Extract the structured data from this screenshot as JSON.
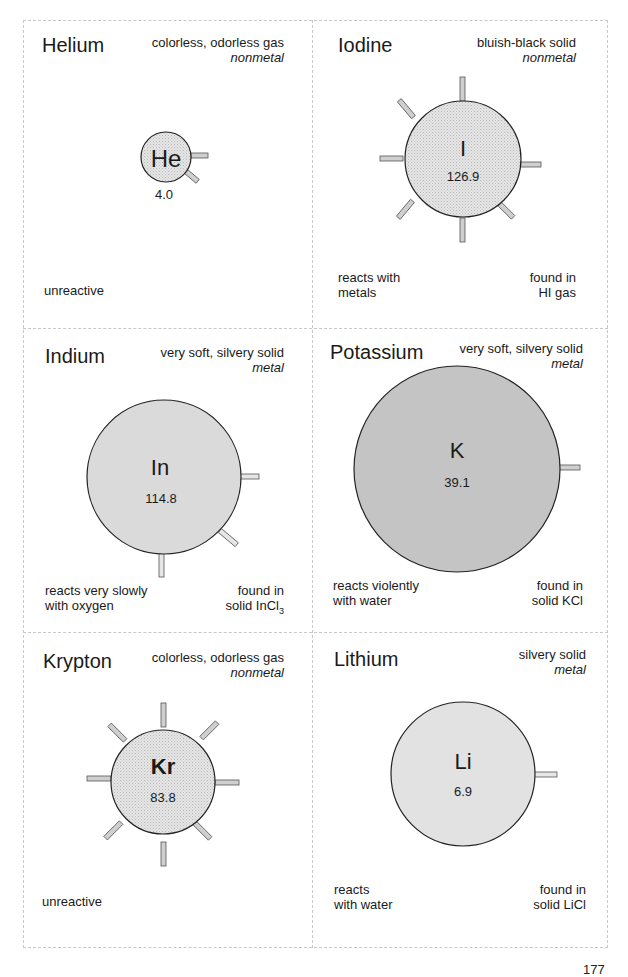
{
  "page_number": "177",
  "colors": {
    "border_dashed": "#c8c8c8",
    "circle_stroke": "#222222",
    "fill_light": "#e4e4e4",
    "fill_medium": "#d9d9d9",
    "fill_dark": "#bdbdbd",
    "stub_fill": "#cfcfcf"
  },
  "elements": [
    {
      "name": "Helium",
      "symbol": "He",
      "atomic_mass": "4.0",
      "description": "colorless, odorless gas",
      "classification": "nonmetal",
      "reactivity": "unreactive",
      "found_in": "",
      "fill": "hatched",
      "bonds": 2
    },
    {
      "name": "Iodine",
      "symbol": "I",
      "atomic_mass": "126.9",
      "description": "bluish-black solid",
      "classification": "nonmetal",
      "reactivity": "reacts with\nmetals",
      "found_in": "found in\nHI gas",
      "fill": "hatched",
      "bonds": 7
    },
    {
      "name": "Indium",
      "symbol": "In",
      "atomic_mass": "114.8",
      "description": "very soft, silvery solid",
      "classification": "metal",
      "reactivity": "reacts very slowly\nwith oxygen",
      "found_in_line1": "found in",
      "found_in_line2": "solid InCl",
      "found_in_sub": "3",
      "fill": "solid-light",
      "bonds": 3
    },
    {
      "name": "Potassium",
      "symbol": "K",
      "atomic_mass": "39.1",
      "description": "very soft, silvery solid",
      "classification": "metal",
      "reactivity": "reacts violently\nwith water",
      "found_in": "found in\nsolid KCl",
      "fill": "solid-dark",
      "bonds": 1
    },
    {
      "name": "Krypton",
      "symbol": "Kr",
      "atomic_mass": "83.8",
      "description": "colorless, odorless gas",
      "classification": "nonmetal",
      "reactivity": "unreactive",
      "found_in": "",
      "fill": "hatched",
      "bonds": 8
    },
    {
      "name": "Lithium",
      "symbol": "Li",
      "atomic_mass": "6.9",
      "description": "silvery solid",
      "classification": "metal",
      "reactivity": "reacts\nwith water",
      "found_in": "found in\nsolid LiCl",
      "fill": "solid-light",
      "bonds": 1
    }
  ]
}
